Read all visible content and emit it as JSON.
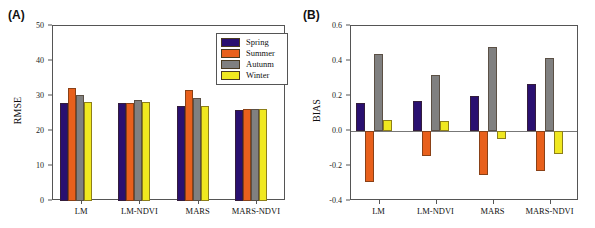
{
  "figure": {
    "panels": [
      {
        "tag": "(A)",
        "ylabel": "RMSE"
      },
      {
        "tag": "(B)",
        "ylabel": "BIAS"
      }
    ]
  },
  "legend": {
    "position": "top-right-panel-a",
    "entries": [
      {
        "label": "Spring",
        "color": "#2a1070"
      },
      {
        "label": "Summer",
        "color": "#e8601c"
      },
      {
        "label": "Autunm",
        "color": "#808080"
      },
      {
        "label": "Winter",
        "color": "#f0e820"
      }
    ]
  },
  "chart_data": [
    {
      "type": "bar",
      "panel": "(A)",
      "title": "",
      "xlabel": "",
      "ylabel": "RMSE",
      "ylim": [
        0,
        50
      ],
      "yticks": [
        0,
        10,
        20,
        30,
        40,
        50
      ],
      "ytick_labels": [
        "0",
        "10",
        "20",
        "30",
        "40",
        "50"
      ],
      "grid": false,
      "legend_position": "upper right",
      "categories": [
        "LM",
        "LM-NDVI",
        "MARS",
        "MARS-NDVI"
      ],
      "series": [
        {
          "name": "Spring",
          "color": "#2a1070",
          "values": [
            28.0,
            27.9,
            27.1,
            26.0
          ]
        },
        {
          "name": "Summer",
          "color": "#e8601c",
          "values": [
            32.2,
            28.1,
            31.6,
            26.2
          ]
        },
        {
          "name": "Autunm",
          "color": "#808080",
          "values": [
            30.3,
            28.8,
            29.4,
            26.4
          ]
        },
        {
          "name": "Winter",
          "color": "#f0e820",
          "values": [
            28.3,
            28.3,
            27.2,
            26.2
          ]
        }
      ]
    },
    {
      "type": "bar",
      "panel": "(B)",
      "title": "",
      "xlabel": "",
      "ylabel": "BIAS",
      "ylim": [
        -0.4,
        0.6
      ],
      "yticks": [
        -0.4,
        -0.2,
        0.0,
        0.2,
        0.4,
        0.6
      ],
      "ytick_labels": [
        "-0.4",
        "-0.2",
        "0.0",
        "0.2",
        "0.4",
        "0.6"
      ],
      "grid": false,
      "zero_line": true,
      "legend_position": "none",
      "categories": [
        "LM",
        "LM-NDVI",
        "MARS",
        "MARS-NDVI"
      ],
      "series": [
        {
          "name": "Spring",
          "color": "#2a1070",
          "values": [
            0.16,
            0.17,
            0.2,
            0.27
          ]
        },
        {
          "name": "Summer",
          "color": "#e8601c",
          "values": [
            -0.29,
            -0.145,
            -0.25,
            -0.23
          ]
        },
        {
          "name": "Autunm",
          "color": "#808080",
          "values": [
            0.44,
            0.32,
            0.48,
            0.42
          ]
        },
        {
          "name": "Winter",
          "color": "#f0e820",
          "values": [
            0.065,
            0.06,
            -0.045,
            -0.13
          ]
        }
      ]
    }
  ]
}
